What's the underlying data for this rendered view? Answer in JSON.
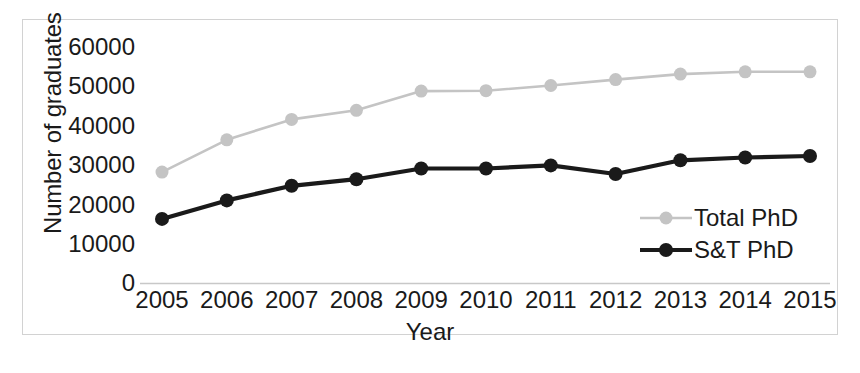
{
  "chart_data": {
    "type": "line",
    "title": "",
    "xlabel": "Year",
    "ylabel": "Number of graduates",
    "categories": [
      "2005",
      "2006",
      "2007",
      "2008",
      "2009",
      "2010",
      "2011",
      "2012",
      "2013",
      "2014",
      "2015"
    ],
    "ylim": [
      0,
      60000
    ],
    "ytick_labels": [
      "0",
      "10000",
      "20000",
      "30000",
      "40000",
      "50000",
      "60000"
    ],
    "ytick_values": [
      0,
      10000,
      20000,
      30000,
      40000,
      50000,
      60000
    ],
    "grid": false,
    "legend_position": "lower-right-inside",
    "series": [
      {
        "name": "Total PhD",
        "color": "#c4c4c4",
        "marker": "circle",
        "values": [
          28200,
          36400,
          41600,
          43900,
          48800,
          48900,
          50200,
          51700,
          53100,
          53700,
          53700
        ]
      },
      {
        "name": "S&T PhD",
        "color": "#1a1a1a",
        "marker": "circle",
        "values": [
          16300,
          21000,
          24700,
          26400,
          29100,
          29100,
          29900,
          27700,
          31200,
          31900,
          32300
        ]
      }
    ]
  },
  "figure": {
    "frame_color": "#d2d2d2",
    "background": "#ffffff",
    "axis_color": "#c8c8c8"
  }
}
